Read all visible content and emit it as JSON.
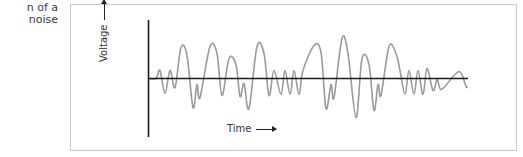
{
  "caption": {
    "line1": "n of a",
    "line2": "noise"
  },
  "figure": {
    "ylabel": "Voltage",
    "xlabel": "Time",
    "colors": {
      "frame": "#c9c9c9",
      "axes": "#1a1a1a",
      "signal": "#9a9a9a",
      "text": "#333333"
    }
  },
  "chart_data": {
    "type": "line",
    "title": "",
    "xlabel": "Time",
    "ylabel": "Voltage",
    "grid": false,
    "legend": null,
    "baseline": 0,
    "x": [
      0,
      8,
      12,
      17,
      22,
      27,
      33,
      39,
      45,
      49,
      52,
      62,
      69,
      74,
      81,
      88,
      92,
      96,
      101,
      109,
      116,
      121,
      126,
      133,
      137,
      142,
      146,
      151,
      155,
      166,
      173,
      178,
      183,
      186,
      194,
      200,
      208,
      214,
      221,
      226,
      230,
      233,
      241,
      248,
      252,
      257,
      261,
      266,
      270,
      275,
      279,
      285,
      289,
      292,
      296,
      311,
      318,
      319
    ],
    "y": [
      0,
      0,
      8,
      -15,
      8,
      -9,
      31,
      23,
      -29,
      -6,
      -19,
      32,
      25,
      -17,
      20,
      14,
      -18,
      -5,
      -30,
      32,
      25,
      -17,
      8,
      -16,
      8,
      -16,
      8,
      -16,
      8,
      33,
      26,
      -30,
      -6,
      -19,
      40,
      25,
      -39,
      20,
      14,
      -32,
      -6,
      -17,
      32,
      25,
      8,
      -16,
      8,
      -16,
      8,
      -16,
      10,
      -12,
      -1,
      -10,
      -9,
      7,
      -8,
      -8
    ],
    "ylim": [
      -45,
      45
    ],
    "annotations": [
      "Voltage ↑ (vertical axis arrow)",
      "Time → (horizontal axis arrow)"
    ]
  }
}
